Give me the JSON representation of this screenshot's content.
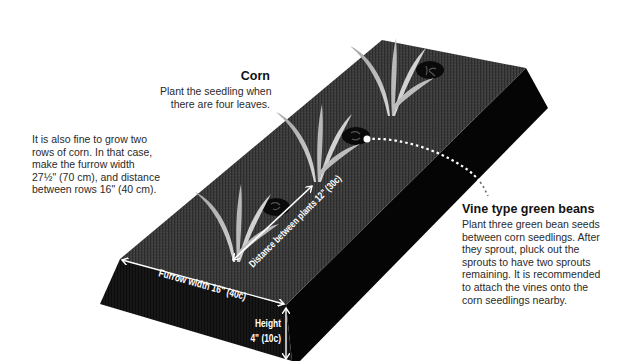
{
  "corn": {
    "title": "Corn",
    "lines": [
      "Plant the seedling when",
      "there are four leaves."
    ]
  },
  "two_rows_note": {
    "lines": [
      "It is also fine to grow two",
      "rows of corn. In that case,",
      "make the furrow width",
      "27½\" (70 cm), and distance",
      "between rows 16\" (40 cm)."
    ]
  },
  "green_beans": {
    "title": "Vine type green beans",
    "lines": [
      "Plant three green bean seeds",
      "between corn seedlings. After",
      "they sprout, pluck out the",
      "sprouts to have two sprouts",
      "remaining. It is recommended",
      "to attach the vines onto the",
      "corn seedlings nearby."
    ]
  },
  "dimensions": {
    "distance_between_plants": "Distance between plants 12\" (30c)",
    "furrow_width": "Furrow width 16\" (40c)",
    "height_label": "Height",
    "height_value": "4\" (10c)"
  },
  "colors": {
    "bed_top": "#3a3a3a",
    "bed_side": "#050505",
    "bed_front": "#141414",
    "corn_leaf": "#c9c9c9",
    "corn_leaf_dark": "#9a9a9a",
    "seed": "#0a0a0a",
    "annotation": "#ffffff"
  }
}
